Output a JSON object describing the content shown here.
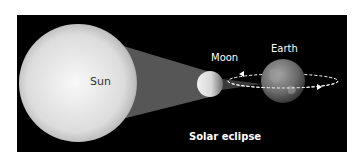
{
  "diagram": {
    "caption": "Solar eclipse",
    "bodies": [
      {
        "name": "Sun",
        "label": "Sun"
      },
      {
        "name": "Moon",
        "label": "Moon"
      },
      {
        "name": "Earth",
        "label": "Earth"
      }
    ],
    "colors": {
      "background": "#000000",
      "sun": "#e8e8e8",
      "shadow_cone": "#555555",
      "earth": "#6b6b6b",
      "orbit": "#ffffff"
    }
  }
}
